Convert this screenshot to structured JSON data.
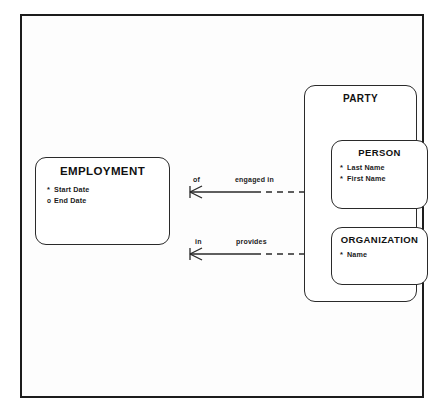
{
  "diagram": {
    "type": "entity-relationship-diagram",
    "notation": "barker",
    "entities": [
      {
        "id": "employment",
        "name": "EMPLOYMENT",
        "attributes": [
          {
            "marker": "*",
            "optionality": "mandatory",
            "name": "Start Date"
          },
          {
            "marker": "o",
            "optionality": "optional",
            "name": "End Date"
          }
        ]
      },
      {
        "id": "party",
        "name": "PARTY",
        "role": "supertype",
        "attributes": [],
        "subtypes": [
          {
            "id": "person",
            "name": "PERSON",
            "attributes": [
              {
                "marker": "*",
                "optionality": "mandatory",
                "name": "Last Name"
              },
              {
                "marker": "*",
                "optionality": "mandatory",
                "name": "First Name"
              }
            ]
          },
          {
            "id": "organization",
            "name": "ORGANIZATION",
            "attributes": [
              {
                "marker": "*",
                "optionality": "mandatory",
                "name": "Name"
              }
            ]
          }
        ]
      }
    ],
    "relationships": [
      {
        "id": "employment-person",
        "from": "EMPLOYMENT",
        "to": "PERSON",
        "near_label": "of",
        "far_label": "engaged in",
        "from_end": "crows-foot",
        "from_line": "solid",
        "to_line": "dashed"
      },
      {
        "id": "employment-organization",
        "from": "EMPLOYMENT",
        "to": "ORGANIZATION",
        "near_label": "in",
        "far_label": "provides",
        "from_end": "crows-foot",
        "from_line": "solid",
        "to_line": "dashed"
      }
    ],
    "colors": {
      "frame": "#1c1c1c",
      "entity_border": "#2a2a2a",
      "line": "#2a2a2a",
      "text": "#1a1a1a",
      "background": "#fdfdfd"
    }
  }
}
